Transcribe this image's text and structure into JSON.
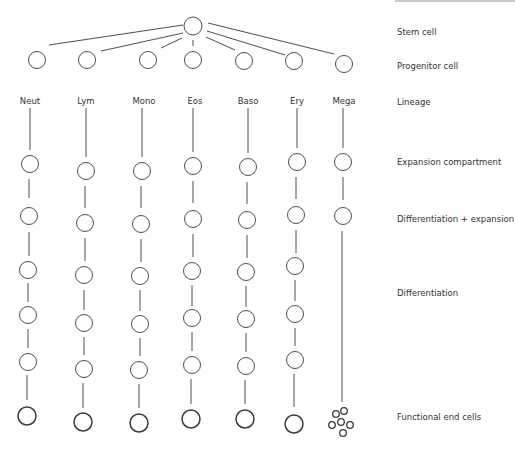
{
  "diagram": {
    "row_labels": {
      "stem": "Stem cell",
      "progenitor": "Progenitor cell",
      "lineage": "Lineage",
      "expansion": "Expansion compartment",
      "diff_expansion": "Differentiation + expansion",
      "differentiation": "Differentiation",
      "functional": "Functional end cells"
    },
    "lineages": [
      {
        "label": "Neut",
        "x": 29
      },
      {
        "label": "Lym",
        "x": 85
      },
      {
        "label": "Mono",
        "x": 141
      },
      {
        "label": "Eos",
        "x": 193
      },
      {
        "label": "Baso",
        "x": 247
      },
      {
        "label": "Ery",
        "x": 296
      },
      {
        "label": "Mega",
        "x": 343
      }
    ],
    "stem_cell": {
      "x": 193,
      "y": 26,
      "r": 9
    },
    "progenitors_y": 61,
    "colors": {
      "stroke": "#3a3a3a",
      "text": "#333333",
      "background": "#ffffff"
    }
  }
}
